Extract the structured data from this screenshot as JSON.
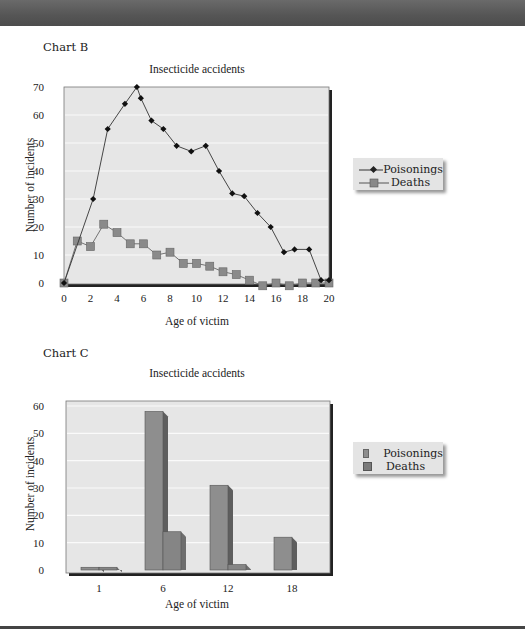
{
  "page": {
    "chart_b_label": "Chart B",
    "chart_c_label": "Chart C"
  },
  "chart_b": {
    "title": "Insecticide accidents",
    "ylabel": "Number of incidents",
    "xlabel": "Age of victim",
    "yticks": [
      "0",
      "10",
      "20",
      "30",
      "40",
      "50",
      "60",
      "70"
    ],
    "xticks": [
      "0",
      "2",
      "4",
      "6",
      "8",
      "10",
      "12",
      "14",
      "16",
      "18",
      "20"
    ],
    "legend": [
      "Poisonings",
      "Deaths"
    ]
  },
  "chart_c": {
    "title": "Insecticide accidents",
    "ylabel": "Number of incidents",
    "xlabel": "Age of victim",
    "yticks": [
      "0",
      "10",
      "20",
      "30",
      "40",
      "50",
      "60"
    ],
    "xticks": [
      "1",
      "6",
      "12",
      "18"
    ],
    "legend": [
      "Poisonings",
      "Deaths"
    ]
  },
  "chart_data": [
    {
      "type": "line",
      "title": "Insecticide accidents",
      "xlabel": "Age of victim",
      "ylabel": "Number of incidents",
      "xlim": [
        0,
        20
      ],
      "ylim": [
        0,
        70
      ],
      "grid": true,
      "legend_position": "right",
      "series": [
        {
          "name": "Poisonings",
          "marker": "diamond",
          "x": [
            0,
            2.2,
            3.3,
            4.6,
            5.5,
            5.8,
            6.6,
            7.5,
            8.5,
            9.6,
            10.7,
            11.7,
            12.7,
            13.6,
            14.6,
            15.6,
            16.6,
            17.4,
            18.5,
            19.4,
            20
          ],
          "y": [
            0,
            30,
            55,
            64,
            70,
            66,
            58,
            55,
            49,
            47,
            49,
            40,
            32,
            31,
            25,
            20,
            11,
            12,
            12,
            1,
            1
          ]
        },
        {
          "name": "Deaths",
          "marker": "square",
          "x": [
            0,
            1,
            2,
            3,
            4,
            5,
            6,
            7,
            8,
            9,
            10,
            11,
            12,
            13,
            14,
            15,
            16,
            17,
            18,
            19,
            20
          ],
          "y": [
            0,
            15,
            13,
            21,
            18,
            14,
            14,
            10,
            11,
            7,
            7,
            6,
            4,
            3,
            1,
            -1,
            0,
            -1,
            0,
            0,
            0
          ]
        }
      ]
    },
    {
      "type": "bar",
      "title": "Insecticide accidents",
      "xlabel": "Age of victim",
      "ylabel": "Number of incidents",
      "ylim": [
        0,
        60
      ],
      "grid": true,
      "legend_position": "right",
      "categories": [
        "1",
        "6",
        "12",
        "18"
      ],
      "series": [
        {
          "name": "Poisonings",
          "values": [
            1,
            58,
            31,
            12
          ]
        },
        {
          "name": "Deaths",
          "values": [
            1,
            14,
            2,
            0
          ]
        }
      ]
    }
  ]
}
